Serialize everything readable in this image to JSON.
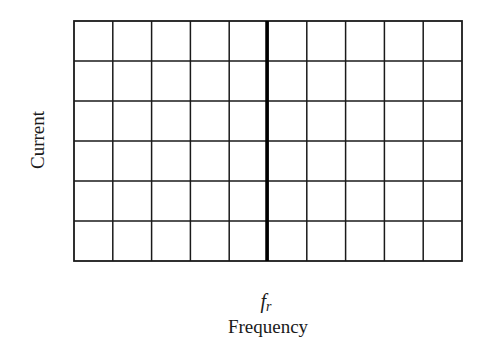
{
  "chart_data": {
    "type": "line",
    "title": "",
    "xlabel": "Frequency",
    "ylabel": "Current",
    "x_annotation": {
      "symbol": "f",
      "subscript": "r",
      "position_fraction": 0.5
    },
    "grid": {
      "on": true,
      "columns": 10,
      "rows": 6
    },
    "series": [],
    "reference_lines": [
      {
        "orientation": "vertical",
        "at": "f_r",
        "style": "thick"
      }
    ],
    "xlim": [
      0,
      10
    ],
    "ylim": [
      0,
      6
    ],
    "tick_labels": {
      "x": [],
      "y": []
    },
    "legend": null
  },
  "labels": {
    "ylabel": "Current",
    "xlabel": "Frequency",
    "fr_symbol": "f",
    "fr_subscript": "r"
  },
  "colors": {
    "grid": "#1a1a1a",
    "background": "#ffffff"
  }
}
